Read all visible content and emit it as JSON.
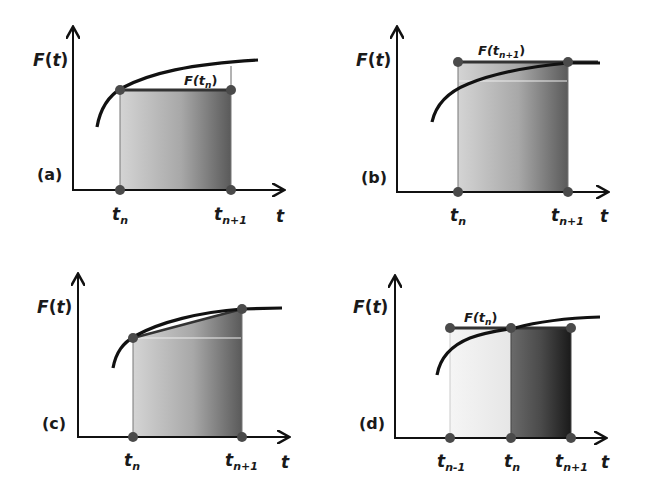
{
  "figure": {
    "panels": [
      {
        "id": "a",
        "panel_label": "(a)",
        "y_axis_label": "F(t)",
        "x_axis_label": "t",
        "ticks": [
          {
            "main": "t",
            "sub": "n"
          },
          {
            "main": "t",
            "sub": "n+1"
          }
        ],
        "annotation": {
          "main": "F(t",
          "sub": "n",
          "close": ")"
        },
        "method": "left rectangle (explicit Euler) — height F(t_n)"
      },
      {
        "id": "b",
        "panel_label": "(b)",
        "y_axis_label": "F(t)",
        "x_axis_label": "t",
        "ticks": [
          {
            "main": "t",
            "sub": "n"
          },
          {
            "main": "t",
            "sub": "n+1"
          }
        ],
        "annotation": {
          "main": "F(t",
          "sub": "n+1",
          "close": ")"
        },
        "method": "right rectangle (implicit Euler) — height F(t_n+1)"
      },
      {
        "id": "c",
        "panel_label": "(c)",
        "y_axis_label": "F(t)",
        "x_axis_label": "t",
        "ticks": [
          {
            "main": "t",
            "sub": "n"
          },
          {
            "main": "t",
            "sub": "n+1"
          }
        ],
        "method": "trapezoid"
      },
      {
        "id": "d",
        "panel_label": "(d)",
        "y_axis_label": "F(t)",
        "x_axis_label": "t",
        "ticks": [
          {
            "main": "t",
            "sub": "n-1"
          },
          {
            "main": "t",
            "sub": "n"
          },
          {
            "main": "t",
            "sub": "n+1"
          }
        ],
        "annotation": {
          "main": "F(t",
          "sub": "n",
          "close": ")"
        },
        "method": "midpoint / leapfrog — height F(t_n) over two steps"
      }
    ],
    "colors": {
      "line": "#111111",
      "point": "#4a4a4a",
      "fill_light": "#d8d8d8",
      "fill_dark": "#3a3a3a",
      "fill_pale": "#f2f2f2"
    }
  }
}
